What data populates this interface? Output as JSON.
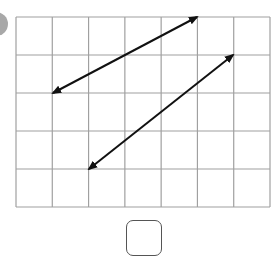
{
  "grid": {
    "x0": 16,
    "y0": 17,
    "x1": 270,
    "y1": 207,
    "columns": 7,
    "rows": 5,
    "line_color": "#a0a0a0"
  },
  "arrows": [
    {
      "name": "arrow-1",
      "from": [
        197,
        17
      ],
      "to": [
        53,
        93
      ],
      "double_headed": true
    },
    {
      "name": "arrow-2",
      "from": [
        233,
        55
      ],
      "to": [
        89,
        169
      ],
      "double_headed": true
    }
  ],
  "answer_box": {
    "value": ""
  }
}
